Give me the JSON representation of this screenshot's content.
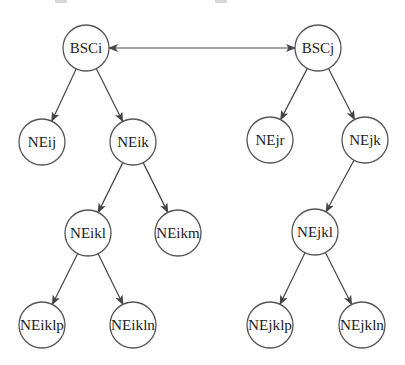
{
  "diagram": {
    "type": "tree-network",
    "colors": {
      "stroke": "#555555",
      "edge": "#444444",
      "text": "#222222",
      "fill": "#ffffff"
    },
    "node_radius": 23,
    "nodes": [
      {
        "id": "BSCi",
        "label": "BSCi",
        "x": 86,
        "y": 48
      },
      {
        "id": "BSCj",
        "label": "BSCj",
        "x": 318,
        "y": 48
      },
      {
        "id": "NEij",
        "label": "NEij",
        "x": 42,
        "y": 142
      },
      {
        "id": "NEik",
        "label": "NEik",
        "x": 133,
        "y": 142
      },
      {
        "id": "NEjr",
        "label": "NEjr",
        "x": 270,
        "y": 140
      },
      {
        "id": "NEjk",
        "label": "NEjk",
        "x": 365,
        "y": 140
      },
      {
        "id": "NEikl",
        "label": "NEikl",
        "x": 88,
        "y": 233
      },
      {
        "id": "NEikm",
        "label": "NEikm",
        "x": 178,
        "y": 233
      },
      {
        "id": "NEjkl",
        "label": "NEjkl",
        "x": 315,
        "y": 232
      },
      {
        "id": "NEiklp",
        "label": "NEiklp",
        "x": 42,
        "y": 325
      },
      {
        "id": "NEikln",
        "label": "NEikln",
        "x": 133,
        "y": 325
      },
      {
        "id": "NEjklp",
        "label": "NEjklp",
        "x": 270,
        "y": 325
      },
      {
        "id": "NEjkln",
        "label": "NEjkln",
        "x": 362,
        "y": 325
      }
    ],
    "edges": [
      {
        "from": "BSCi",
        "to": "BSCj",
        "bidirectional": true
      },
      {
        "from": "BSCi",
        "to": "NEij"
      },
      {
        "from": "BSCi",
        "to": "NEik"
      },
      {
        "from": "BSCj",
        "to": "NEjr"
      },
      {
        "from": "BSCj",
        "to": "NEjk"
      },
      {
        "from": "NEik",
        "to": "NEikl"
      },
      {
        "from": "NEik",
        "to": "NEikm"
      },
      {
        "from": "NEjk",
        "to": "NEjkl"
      },
      {
        "from": "NEikl",
        "to": "NEiklp"
      },
      {
        "from": "NEikl",
        "to": "NEikln"
      },
      {
        "from": "NEjkl",
        "to": "NEjklp"
      },
      {
        "from": "NEjkl",
        "to": "NEjkln"
      }
    ]
  }
}
